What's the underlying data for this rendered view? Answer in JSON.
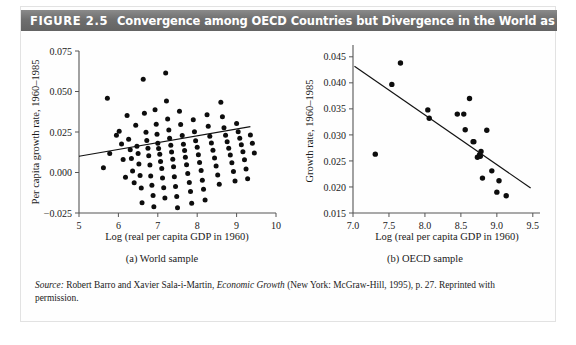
{
  "figure": {
    "label": "FIGURE 2.5",
    "title": "Convergence among OECD Countries but Divergence in the World as a Whole",
    "source_prefix": "Source:",
    "source_text_1": " Robert Barro and Xavier Sala-i-Martin, ",
    "source_italic": "Economic Growth",
    "source_text_2": " (New York: McGraw-Hill, 1995), p. 27. Reprinted with permission."
  },
  "panel_a": {
    "caption": "(a) World sample",
    "xlabel": "Log (real per capita GDP in 1960)",
    "ylabel": "Per capita growth rate, 1960–1985",
    "xticks": [
      "5",
      "6",
      "7",
      "8",
      "9",
      "10"
    ],
    "yticks": [
      "0.075",
      "0.050",
      "0.025",
      "0.000",
      "−0.025"
    ]
  },
  "panel_b": {
    "caption": "(b) OECD sample",
    "xlabel": "Log (real per capita GDP in 1960)",
    "ylabel": "Growth rate, 1960–1985",
    "xticks": [
      "7.0",
      "7.5",
      "8.0",
      "8.5",
      "9.0",
      "9.5"
    ],
    "yticks": [
      "0.045",
      "0.040",
      "0.035",
      "0.030",
      "0.025",
      "0.020",
      "0.015"
    ]
  },
  "colors": {
    "header_bar": "#6f6f6f",
    "header_text": "#ffffff",
    "point": "#0d0d0d",
    "trend_line": "#111111",
    "axis": "#555555",
    "panel_background": "#fefefe"
  },
  "chart_data": [
    {
      "type": "scatter",
      "id": "panel_a",
      "title": "(a) World sample",
      "xlabel": "Log (real per capita GDP in 1960)",
      "ylabel": "Per capita growth rate, 1960–1985",
      "xlim": [
        5.0,
        10.0
      ],
      "ylim": [
        -0.025,
        0.075
      ],
      "xticks": [
        5,
        6,
        7,
        8,
        9,
        10
      ],
      "yticks": [
        -0.025,
        0.0,
        0.025,
        0.05,
        0.075
      ],
      "grid": false,
      "legend": null,
      "trend_line": {
        "x": [
          5.0,
          9.35
        ],
        "y": [
          0.01,
          0.0283
        ],
        "slope_sign": "positive"
      },
      "points": [
        [
          5.72,
          0.0458
        ],
        [
          5.78,
          0.0118
        ],
        [
          5.62,
          0.003
        ],
        [
          5.95,
          0.023
        ],
        [
          6.02,
          0.0254
        ],
        [
          6.08,
          0.0176
        ],
        [
          6.12,
          0.008
        ],
        [
          6.18,
          -0.003
        ],
        [
          6.22,
          0.0352
        ],
        [
          6.26,
          0.0206
        ],
        [
          6.3,
          0.014
        ],
        [
          6.33,
          0.0086
        ],
        [
          6.36,
          0.001
        ],
        [
          6.4,
          -0.0064
        ],
        [
          6.44,
          0.0292
        ],
        [
          6.47,
          0.0162
        ],
        [
          6.5,
          0.0118
        ],
        [
          6.52,
          0.0052
        ],
        [
          6.55,
          -0.0018
        ],
        [
          6.58,
          -0.0096
        ],
        [
          6.6,
          -0.0186
        ],
        [
          6.63,
          0.0576
        ],
        [
          6.66,
          0.0366
        ],
        [
          6.7,
          0.0248
        ],
        [
          6.72,
          0.0198
        ],
        [
          6.75,
          0.015
        ],
        [
          6.77,
          0.0104
        ],
        [
          6.8,
          0.0046
        ],
        [
          6.82,
          -0.0022
        ],
        [
          6.85,
          -0.0078
        ],
        [
          6.88,
          -0.0142
        ],
        [
          6.9,
          -0.0212
        ],
        [
          6.93,
          0.0388
        ],
        [
          6.96,
          0.0298
        ],
        [
          6.98,
          0.0236
        ],
        [
          7.0,
          0.018
        ],
        [
          7.02,
          0.0148
        ],
        [
          7.05,
          0.0112
        ],
        [
          7.07,
          0.0068
        ],
        [
          7.1,
          0.0024
        ],
        [
          7.12,
          -0.0034
        ],
        [
          7.15,
          -0.0094
        ],
        [
          7.18,
          -0.0158
        ],
        [
          7.2,
          0.0614
        ],
        [
          7.22,
          0.0442
        ],
        [
          7.25,
          0.033
        ],
        [
          7.28,
          0.0262
        ],
        [
          7.3,
          0.0212
        ],
        [
          7.33,
          0.0168
        ],
        [
          7.35,
          0.0126
        ],
        [
          7.38,
          0.0082
        ],
        [
          7.4,
          0.0036
        ],
        [
          7.42,
          -0.0026
        ],
        [
          7.45,
          -0.0086
        ],
        [
          7.48,
          -0.0148
        ],
        [
          7.5,
          -0.0218
        ],
        [
          7.55,
          0.0378
        ],
        [
          7.58,
          0.0296
        ],
        [
          7.62,
          0.0228
        ],
        [
          7.65,
          0.0174
        ],
        [
          7.68,
          0.0136
        ],
        [
          7.7,
          0.0094
        ],
        [
          7.73,
          0.0048
        ],
        [
          7.76,
          -0.0006
        ],
        [
          7.8,
          -0.0062
        ],
        [
          7.83,
          -0.0118
        ],
        [
          7.86,
          -0.019
        ],
        [
          7.9,
          0.0326
        ],
        [
          7.93,
          0.0252
        ],
        [
          7.96,
          0.0196
        ],
        [
          8.0,
          0.0156
        ],
        [
          8.03,
          0.011
        ],
        [
          8.06,
          0.0062
        ],
        [
          8.1,
          0.0012
        ],
        [
          8.13,
          -0.0048
        ],
        [
          8.16,
          -0.0104
        ],
        [
          8.2,
          -0.017
        ],
        [
          8.25,
          0.0356
        ],
        [
          8.28,
          0.0286
        ],
        [
          8.32,
          0.0224
        ],
        [
          8.36,
          0.0182
        ],
        [
          8.4,
          0.0138
        ],
        [
          8.44,
          0.009
        ],
        [
          8.48,
          0.004
        ],
        [
          8.52,
          -0.0016
        ],
        [
          8.56,
          -0.0072
        ],
        [
          8.6,
          0.0434
        ],
        [
          8.64,
          0.0344
        ],
        [
          8.68,
          0.0276
        ],
        [
          8.72,
          0.023
        ],
        [
          8.76,
          0.019
        ],
        [
          8.8,
          0.015
        ],
        [
          8.84,
          0.0108
        ],
        [
          8.88,
          0.006
        ],
        [
          8.92,
          0.0006
        ],
        [
          8.96,
          -0.0052
        ],
        [
          9.0,
          0.0302
        ],
        [
          9.04,
          0.0252
        ],
        [
          9.08,
          0.0212
        ],
        [
          9.12,
          0.0172
        ],
        [
          9.16,
          0.0128
        ],
        [
          9.2,
          0.0078
        ],
        [
          9.24,
          0.0022
        ],
        [
          9.28,
          -0.0038
        ],
        [
          9.35,
          0.0232
        ],
        [
          9.4,
          0.018
        ],
        [
          9.45,
          0.012
        ]
      ]
    },
    {
      "type": "scatter",
      "id": "panel_b",
      "title": "(b) OECD sample",
      "xlabel": "Log (real per capita GDP in 1960)",
      "ylabel": "Growth rate, 1960–1985",
      "xlim": [
        7.0,
        9.6
      ],
      "ylim": [
        0.015,
        0.0465
      ],
      "xticks": [
        7.0,
        7.5,
        8.0,
        8.5,
        9.0,
        9.5
      ],
      "yticks": [
        0.015,
        0.02,
        0.025,
        0.03,
        0.035,
        0.04,
        0.045
      ],
      "grid": false,
      "legend": null,
      "trend_line": {
        "x": [
          7.02,
          9.47
        ],
        "y": [
          0.0432,
          0.0198
        ],
        "slope_sign": "negative"
      },
      "points": [
        [
          7.31,
          0.0263
        ],
        [
          7.54,
          0.0397
        ],
        [
          7.66,
          0.0438
        ],
        [
          8.04,
          0.0348
        ],
        [
          8.06,
          0.0332
        ],
        [
          8.45,
          0.034
        ],
        [
          8.54,
          0.034
        ],
        [
          8.56,
          0.031
        ],
        [
          8.62,
          0.037
        ],
        [
          8.67,
          0.0287
        ],
        [
          8.68,
          0.0287
        ],
        [
          8.73,
          0.0257
        ],
        [
          8.76,
          0.0262
        ],
        [
          8.77,
          0.0259
        ],
        [
          8.78,
          0.0268
        ],
        [
          8.8,
          0.0217
        ],
        [
          8.86,
          0.0309
        ],
        [
          8.93,
          0.0231
        ],
        [
          9.0,
          0.019
        ],
        [
          9.03,
          0.0212
        ],
        [
          9.13,
          0.0183
        ]
      ]
    }
  ]
}
